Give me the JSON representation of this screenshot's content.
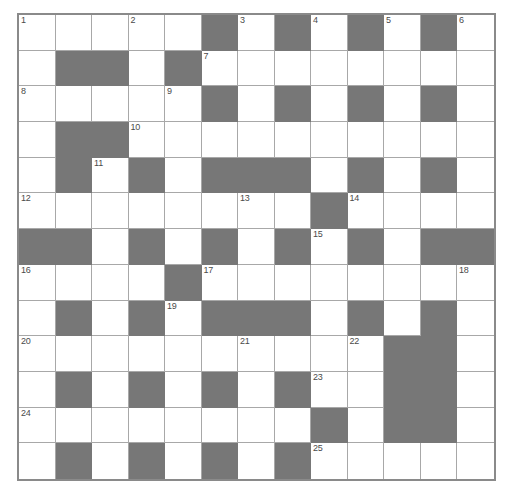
{
  "puzzle": {
    "kind": "crossword-grid",
    "rows": 13,
    "cols": 13,
    "cell_size": 36.5,
    "row_height": 35.7,
    "colors": {
      "block": "#777777",
      "cell": "#ffffff",
      "grid_line": "#a8a8a8",
      "border": "#8a8a8a",
      "number_text": "#4a4a4a"
    },
    "grid": [
      [
        0,
        0,
        0,
        0,
        0,
        1,
        0,
        1,
        0,
        1,
        0,
        1,
        0
      ],
      [
        0,
        1,
        1,
        0,
        1,
        0,
        0,
        0,
        0,
        0,
        0,
        0,
        0
      ],
      [
        0,
        0,
        0,
        0,
        0,
        1,
        0,
        1,
        0,
        1,
        0,
        1,
        0
      ],
      [
        0,
        1,
        1,
        0,
        0,
        0,
        0,
        0,
        0,
        0,
        0,
        0,
        0
      ],
      [
        0,
        1,
        0,
        1,
        0,
        1,
        1,
        1,
        0,
        1,
        0,
        1,
        0
      ],
      [
        0,
        0,
        0,
        0,
        0,
        0,
        0,
        0,
        1,
        0,
        0,
        0,
        0
      ],
      [
        1,
        1,
        0,
        1,
        0,
        1,
        0,
        1,
        0,
        1,
        0,
        1,
        1
      ],
      [
        0,
        0,
        0,
        0,
        1,
        0,
        0,
        0,
        0,
        0,
        0,
        0,
        0
      ],
      [
        0,
        1,
        0,
        1,
        0,
        1,
        1,
        1,
        0,
        1,
        0,
        1,
        0
      ],
      [
        0,
        0,
        0,
        0,
        0,
        0,
        0,
        0,
        0,
        0,
        1,
        1,
        0
      ],
      [
        0,
        1,
        0,
        1,
        0,
        1,
        0,
        1,
        0,
        0,
        1,
        1,
        0
      ],
      [
        0,
        0,
        0,
        0,
        0,
        0,
        0,
        0,
        1,
        0,
        1,
        1,
        0
      ],
      [
        0,
        1,
        0,
        1,
        0,
        1,
        0,
        1,
        0,
        0,
        0,
        0,
        0
      ]
    ],
    "numbers": [
      {
        "n": "1",
        "row": 1,
        "col": 1
      },
      {
        "n": "2",
        "row": 1,
        "col": 4
      },
      {
        "n": "3",
        "row": 1,
        "col": 7
      },
      {
        "n": "4",
        "row": 1,
        "col": 9
      },
      {
        "n": "5",
        "row": 1,
        "col": 11
      },
      {
        "n": "6",
        "row": 1,
        "col": 13
      },
      {
        "n": "7",
        "row": 2,
        "col": 6
      },
      {
        "n": "8",
        "row": 3,
        "col": 1
      },
      {
        "n": "9",
        "row": 3,
        "col": 5
      },
      {
        "n": "10",
        "row": 4,
        "col": 4
      },
      {
        "n": "11",
        "row": 5,
        "col": 3
      },
      {
        "n": "12",
        "row": 6,
        "col": 1
      },
      {
        "n": "13",
        "row": 6,
        "col": 7
      },
      {
        "n": "14",
        "row": 6,
        "col": 10
      },
      {
        "n": "15",
        "row": 7,
        "col": 9
      },
      {
        "n": "16",
        "row": 8,
        "col": 1
      },
      {
        "n": "17",
        "row": 8,
        "col": 6
      },
      {
        "n": "18",
        "row": 8,
        "col": 13
      },
      {
        "n": "19",
        "row": 9,
        "col": 5
      },
      {
        "n": "20",
        "row": 10,
        "col": 1
      },
      {
        "n": "21",
        "row": 10,
        "col": 7
      },
      {
        "n": "22",
        "row": 10,
        "col": 10
      },
      {
        "n": "23",
        "row": 11,
        "col": 9
      },
      {
        "n": "24",
        "row": 12,
        "col": 1
      },
      {
        "n": "25",
        "row": 13,
        "col": 9
      }
    ],
    "letters": []
  }
}
